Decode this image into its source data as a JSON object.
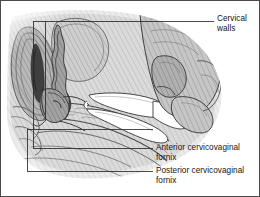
{
  "figure": {
    "type": "medical-anatomical-illustration",
    "view": "sagittal cross-section of female pelvis",
    "style": "grayscale line drawing with diagonal hatch shading",
    "border_color": "#4a4a4a",
    "background_color": "#ffffff",
    "ink_color": "#141414"
  },
  "labels": [
    {
      "id": "cervical-walls",
      "lines": [
        "Cervical",
        "walls"
      ],
      "text": "Cervical walls",
      "x": 216,
      "y": 13
    },
    {
      "id": "anterior-fornix",
      "lines": [
        "Anterior cervicovaginal",
        "fornix"
      ],
      "text": "Anterior cervicovaginal fornix",
      "x": 155,
      "y": 142
    },
    {
      "id": "posterior-fornix",
      "lines": [
        "Posterior cervicovaginal",
        "fornix"
      ],
      "text": "Posterior cervicovaginal fornix",
      "x": 155,
      "y": 165
    }
  ],
  "leader_lines": [
    {
      "id": "leader-cervical-walls",
      "label": "Cervical walls",
      "path": "horizontal rule from callout box to label",
      "from_x": 32,
      "from_y": 20,
      "to_x": 213,
      "to_y": 20
    },
    {
      "id": "leader-anterior-fornix",
      "label": "Anterior cervicovaginal fornix",
      "path": "horizontal rule from callout box to label",
      "from_x": 32,
      "from_y": 147,
      "to_x": 152,
      "to_y": 147
    },
    {
      "id": "leader-posterior-fornix",
      "label": "Posterior cervicovaginal fornix",
      "path": "horizontal rule from callout box to label",
      "from_x": 26,
      "from_y": 170,
      "to_x": 152,
      "to_y": 170
    }
  ],
  "callout_boxes": [
    {
      "id": "callout-upper",
      "x": 32,
      "y": 20,
      "width": 181,
      "height": 127
    },
    {
      "id": "callout-lower",
      "x": 26,
      "y": 128,
      "width": 126,
      "height": 42
    }
  ],
  "anatomy": [
    {
      "id": "uterus",
      "description": "uterus shown in sagittal section at left"
    },
    {
      "id": "cervix",
      "description": "cervix with cervical canal"
    },
    {
      "id": "vagina",
      "description": "vaginal canal"
    },
    {
      "id": "anterior-fornix",
      "description": "anterior cervicovaginal fornix"
    },
    {
      "id": "posterior-fornix",
      "description": "posterior cervicovaginal fornix"
    },
    {
      "id": "rectum",
      "description": "rectum posterior to vagina"
    },
    {
      "id": "bladder",
      "description": "bladder anterior to uterus"
    }
  ],
  "instrument": {
    "id": "speculum",
    "description": "vaginal speculum with upper and lower blades, held by hand",
    "color": "#ffffff"
  },
  "hand": {
    "id": "examining-hand",
    "description": "clinician's hand gripping the speculum handle from upper right"
  }
}
